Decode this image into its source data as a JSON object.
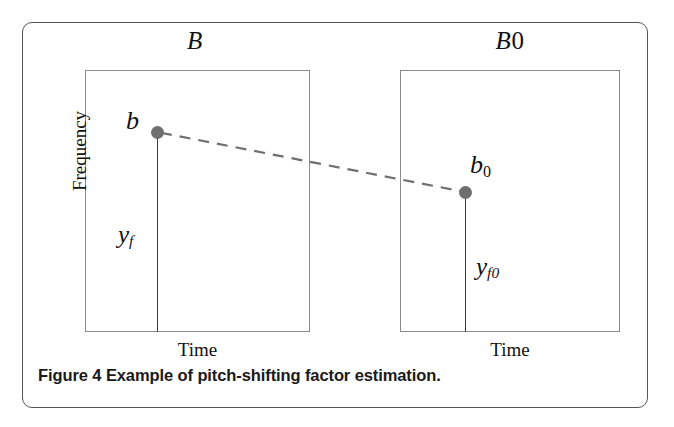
{
  "figure": {
    "caption_number": "Figure 4",
    "caption_text": "Example of pitch-shifting factor estimation.",
    "frame_color": "#565656",
    "plot_border_color": "#8a8a8a",
    "marker_color": "#6f6f6f",
    "stem_color": "#3a3a3a",
    "dash_color": "#6f6f6f",
    "background": "#ffffff"
  },
  "panels": [
    {
      "id": "left",
      "title": "B",
      "title_italic_part": "B",
      "title_upright_part": "",
      "y_axis_label": "Frequency",
      "x_axis_label": "Time",
      "peak_label": "b",
      "peak_subscript": "",
      "magnitude_label": "y",
      "magnitude_subscript": "f"
    },
    {
      "id": "right",
      "title": "B0",
      "title_italic_part": "B",
      "title_upright_part": "0",
      "y_axis_label": "",
      "x_axis_label": "Time",
      "peak_label": "b",
      "peak_subscript": "0",
      "magnitude_label": "y",
      "magnitude_subscript": "f0"
    }
  ],
  "chart_data": {
    "type": "line",
    "title": "Example of pitch-shifting factor estimation",
    "xlabel": "Time",
    "ylabel": "Frequency",
    "grid": false,
    "legend": "none",
    "annotations": [
      {
        "panel": "B",
        "point_label": "b",
        "stem_label": "y_f",
        "x_px": 157,
        "y_px": 132,
        "stem_bottom_px": 332,
        "description": "Peak frequency bin b of the pitch-shifted signal with magnitude y_f"
      },
      {
        "panel": "B0",
        "point_label": "b_0",
        "stem_label": "y_f0",
        "x_px": 465,
        "y_px": 192,
        "stem_bottom_px": 332,
        "description": "Reference peak frequency bin b_0 with magnitude y_f0"
      }
    ],
    "series": [
      {
        "name": "pitch-shift correspondence",
        "style": "dashed",
        "x": [
          157,
          465
        ],
        "y": [
          132,
          192
        ]
      }
    ]
  }
}
